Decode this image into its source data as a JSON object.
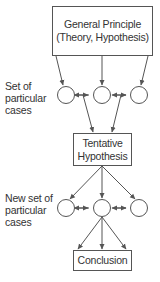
{
  "diagram": {
    "nodes": {
      "general_principle": {
        "line1": "General Principle",
        "line2": "(Theory, Hypothesis)"
      },
      "tentative_hypothesis": {
        "line1": "Tentative",
        "line2": "Hypothesis"
      },
      "conclusion": {
        "label": "Conclusion"
      }
    },
    "labels": {
      "set_cases": {
        "line1": "Set of",
        "line2": "particular",
        "line3": "cases"
      },
      "new_set_cases": {
        "line1": "New set of",
        "line2": "particular",
        "line3": "cases"
      }
    },
    "case_rows": [
      {
        "row": "first",
        "circles": 3
      },
      {
        "row": "second",
        "circles": 3
      }
    ],
    "edges": [
      {
        "from": "General Principle",
        "to": "case 1"
      },
      {
        "from": "General Principle",
        "to": "case 2"
      },
      {
        "from": "General Principle",
        "to": "case 3"
      },
      {
        "from": "case 1",
        "to": "case 2",
        "bidirectional": true
      },
      {
        "from": "case 2",
        "to": "case 3",
        "bidirectional": true
      },
      {
        "from": "link case1-case2",
        "to": "Tentative Hypothesis"
      },
      {
        "from": "link case2-case3",
        "to": "Tentative Hypothesis"
      },
      {
        "from": "Tentative Hypothesis",
        "to": "new case 1"
      },
      {
        "from": "Tentative Hypothesis",
        "to": "new case 2"
      },
      {
        "from": "Tentative Hypothesis",
        "to": "new case 3"
      },
      {
        "from": "new case 1",
        "to": "new case 2",
        "bidirectional": true
      },
      {
        "from": "new case 2",
        "to": "new case 3",
        "bidirectional": true
      },
      {
        "from": "new case 2",
        "to": "Conclusion (left)"
      },
      {
        "from": "new case 2",
        "to": "Conclusion (center)"
      },
      {
        "from": "new case 2",
        "to": "Conclusion (right)"
      }
    ],
    "colors": {
      "line": "#555555",
      "text": "#333333",
      "background": "#ffffff"
    }
  }
}
